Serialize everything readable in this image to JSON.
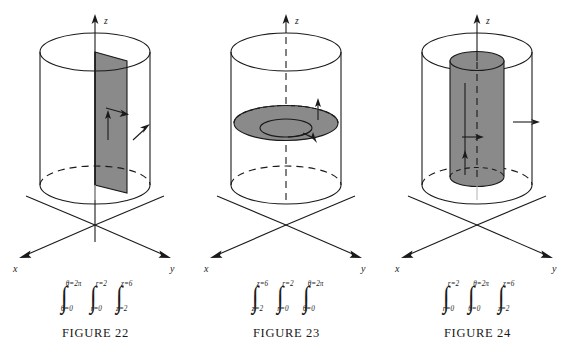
{
  "page": {
    "background": "#ffffff",
    "ink": "#1a1a1a",
    "shade_color": "#8a8a8a"
  },
  "figures": [
    {
      "id": "figure-22",
      "caption": "FIGURE 22",
      "axis_labels": {
        "x": "x",
        "y": "y",
        "z": "z"
      },
      "surface": "constant-theta vertical half-plane",
      "integral": {
        "text": "∫(θ=0 to θ=2π) ∫(r=0 to r=2) ∫(z=2 to z=6)",
        "signs": [
          {
            "upper": "θ=2π",
            "lower": "θ=0"
          },
          {
            "upper": "r=2",
            "lower": "r=0"
          },
          {
            "upper": "z=6",
            "lower": "z=2"
          }
        ]
      }
    },
    {
      "id": "figure-23",
      "caption": "FIGURE 23",
      "axis_labels": {
        "x": "x",
        "y": "y",
        "z": "z"
      },
      "surface": "constant-z horizontal disk",
      "integral": {
        "text": "∫(z=2 to z=6) ∫(r=0 to r=2) ∫(θ=0 to θ=2π)",
        "signs": [
          {
            "upper": "z=6",
            "lower": "z=2"
          },
          {
            "upper": "r=2",
            "lower": "r=0"
          },
          {
            "upper": "θ=2π",
            "lower": "θ=0"
          }
        ]
      }
    },
    {
      "id": "figure-24",
      "caption": "FIGURE 24",
      "axis_labels": {
        "x": "x",
        "y": "y",
        "z": "z"
      },
      "surface": "constant-r inner cylinder",
      "integral": {
        "text": "∫(r=0 to r=2) ∫(θ=0 to θ=2π) ∫(z=2 to z=6)",
        "signs": [
          {
            "upper": "r=2",
            "lower": "r=0"
          },
          {
            "upper": "θ=2π",
            "lower": "θ=0"
          },
          {
            "upper": "z=6",
            "lower": "z=2"
          }
        ]
      }
    }
  ],
  "integral_sign_glyph": "∫"
}
